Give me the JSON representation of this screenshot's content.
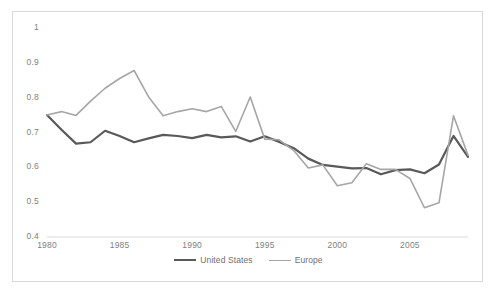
{
  "chart_data": {
    "type": "line",
    "title": "",
    "subtitle": "",
    "xlabel": "",
    "ylabel": "",
    "grid": false,
    "legend_position": "bottom-center",
    "xlim": [
      1980,
      2009
    ],
    "ylim": [
      0.4,
      1.0
    ],
    "y_ticks": [
      "0.4",
      "0.5",
      "0.6",
      "0.7",
      "0.8",
      "0.9",
      "1"
    ],
    "y_tick_values": [
      0.4,
      0.5,
      0.6,
      0.7,
      0.8,
      0.9,
      1.0
    ],
    "x_ticks": [
      "1980",
      "1985",
      "1990",
      "1995",
      "2000",
      "2005"
    ],
    "x_tick_values": [
      1980,
      1985,
      1990,
      1995,
      2000,
      2005
    ],
    "x": [
      1980,
      1981,
      1982,
      1983,
      1984,
      1985,
      1986,
      1987,
      1988,
      1989,
      1990,
      1991,
      1992,
      1993,
      1994,
      1995,
      1996,
      1997,
      1998,
      1999,
      2000,
      2001,
      2002,
      2003,
      2004,
      2005,
      2006,
      2007,
      2008,
      2009
    ],
    "series": [
      {
        "name": "United States",
        "color": "#595959",
        "width": 2.2,
        "values": [
          0.75,
          0.708,
          0.668,
          0.672,
          0.705,
          0.69,
          0.672,
          0.683,
          0.693,
          0.69,
          0.684,
          0.693,
          0.686,
          0.689,
          0.674,
          0.689,
          0.673,
          0.655,
          0.625,
          0.607,
          0.602,
          0.597,
          0.598,
          0.58,
          0.592,
          0.594,
          0.583,
          0.608,
          0.69,
          0.63
        ]
      },
      {
        "name": "Europe",
        "color": "#a6a6a6",
        "width": 1.6,
        "values": [
          0.75,
          0.76,
          0.749,
          0.79,
          0.827,
          0.855,
          0.878,
          0.802,
          0.748,
          0.76,
          0.768,
          0.76,
          0.775,
          0.703,
          0.802,
          0.681,
          0.679,
          0.648,
          0.598,
          0.607,
          0.547,
          0.556,
          0.61,
          0.594,
          0.594,
          0.568,
          0.484,
          0.498,
          0.748,
          0.635
        ]
      }
    ]
  },
  "legend": {
    "items": [
      {
        "label": "United States"
      },
      {
        "label": "Europe"
      }
    ]
  },
  "colors": {
    "united_states": "#595959",
    "europe": "#a6a6a6",
    "axis": "#d9d9d9",
    "border": "#d9d9d9",
    "tick_text": "#7f7f7f"
  }
}
